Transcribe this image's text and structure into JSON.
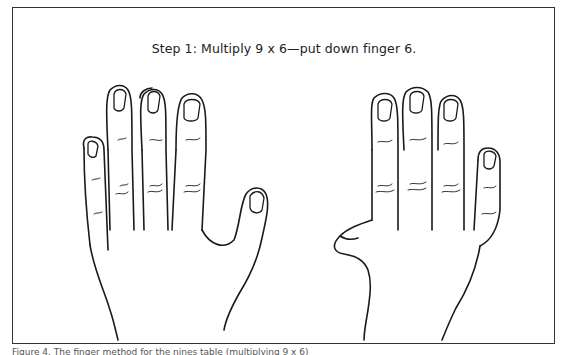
{
  "figure": {
    "title": "Step 1: Multiply 9 x 6—put down finger 6.",
    "caption": "Figure 4.  The finger method for the nines table (multiplying 9 x 6)",
    "hands": [
      {
        "name": "left-hand",
        "fingers_up": [
          1,
          2,
          3,
          4,
          5
        ]
      },
      {
        "name": "right-hand",
        "fingers_up": [
          7,
          8,
          9,
          10
        ],
        "finger_down": 6
      }
    ]
  }
}
